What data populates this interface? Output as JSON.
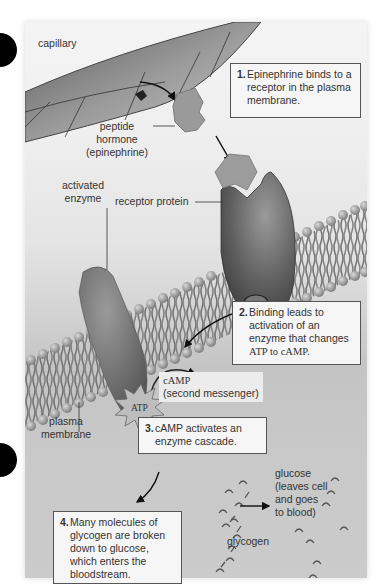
{
  "figure": {
    "labels": {
      "capillary": "capillary",
      "peptide_hormone_line1": "peptide hormone",
      "peptide_hormone_line2": "(epinephrine)",
      "activated_enzyme_line1": "activated",
      "activated_enzyme_line2": "enzyme",
      "receptor_protein": "receptor protein",
      "plasma_membrane_line1": "plasma",
      "plasma_membrane_line2": "membrane",
      "atp": "ATP",
      "camp_line1": "cAMP",
      "camp_line2": "(second messenger)",
      "glucose_line1": "glucose",
      "glucose_line2": "(leaves cell",
      "glucose_line3": "and goes",
      "glucose_line4": "to blood)",
      "glycogen": "glycogen"
    },
    "steps": [
      {
        "num": "1.",
        "lines": [
          "Epinephrine binds to a",
          "receptor in the plasma",
          "membrane."
        ]
      },
      {
        "num": "2.",
        "lines": [
          "Binding leads to",
          "activation of an",
          "enzyme that changes",
          "ATP to cAMP."
        ]
      },
      {
        "num": "3.",
        "lines": [
          "cAMP activates an",
          "enzyme cascade."
        ]
      },
      {
        "num": "4.",
        "lines": [
          "Many molecules of",
          "glycogen are broken",
          "down to glucose,",
          "which enters the",
          "bloodstream."
        ]
      }
    ],
    "colors": {
      "background_top": "#f4f4f4",
      "background_bottom": "#c9c9c9",
      "protein": "#6e6e6e",
      "hormone": "#9a9a9a",
      "box_border": "#555555",
      "bullet": "#000000"
    }
  }
}
